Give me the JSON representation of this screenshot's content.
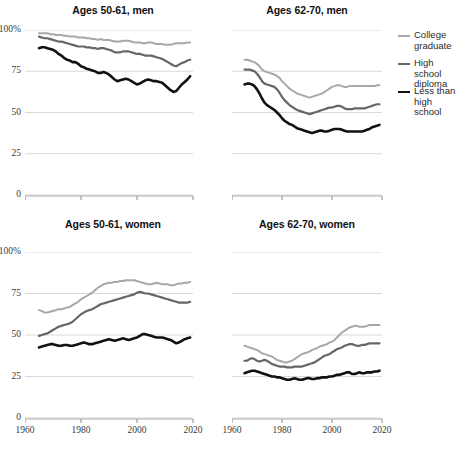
{
  "figure": {
    "width": 460,
    "height": 454,
    "background": "#ffffff"
  },
  "legend": {
    "position": "right-top",
    "items": [
      {
        "label": "College\ngraduate",
        "color": "#a8a8a8",
        "width": 2.0,
        "name": "college-graduate"
      },
      {
        "label": "High school\ndiploma",
        "color": "#666666",
        "width": 2.2,
        "name": "high-school-diploma"
      },
      {
        "label": "Less than\nhigh school",
        "color": "#111111",
        "width": 2.6,
        "name": "less-than-high-school"
      }
    ]
  },
  "axes": {
    "ylim": [
      0,
      100
    ],
    "yticks": [
      0,
      25,
      50,
      75,
      100
    ],
    "yticklabels": [
      "0",
      "25",
      "50",
      "75",
      "100%"
    ],
    "xlim": [
      1960,
      2020
    ],
    "xticks": [
      1960,
      1980,
      2000,
      2020
    ],
    "xticklabels": [
      "1960",
      "1980",
      "2000",
      "2020"
    ],
    "gridcolor": "#d9d9d9",
    "grid": true,
    "legend_shown_on_panel": 1
  },
  "chart_data": {
    "type": "line",
    "title": "",
    "xlabel": "",
    "ylabel": "",
    "ylim": [
      0,
      100
    ],
    "xlim": [
      1960,
      2020
    ],
    "grid": true,
    "legend_position": "right",
    "panels": [
      {
        "title": "Ages 50-61, men",
        "row": 0,
        "col": 0,
        "x": [
          1965,
          1966,
          1967,
          1968,
          1969,
          1970,
          1971,
          1972,
          1973,
          1974,
          1975,
          1976,
          1977,
          1978,
          1979,
          1980,
          1981,
          1982,
          1983,
          1984,
          1985,
          1986,
          1987,
          1988,
          1989,
          1990,
          1991,
          1992,
          1993,
          1994,
          1995,
          1996,
          1997,
          1998,
          1999,
          2000,
          2001,
          2002,
          2003,
          2004,
          2005,
          2006,
          2007,
          2008,
          2009,
          2010,
          2011,
          2012,
          2013,
          2014,
          2015,
          2016,
          2017,
          2018,
          2019
        ],
        "series": [
          {
            "name": "College graduate",
            "color": "#a8a8a8",
            "values": [
              98,
              98,
              98,
              98,
              97.5,
              97.5,
              97,
              97,
              97,
              96.5,
              96.5,
              96,
              96,
              96,
              95.5,
              95.5,
              95.5,
              95,
              95,
              94.5,
              94.5,
              94,
              94.5,
              94,
              94,
              94,
              93.5,
              93,
              93,
              93,
              93.5,
              93.5,
              93.5,
              93,
              92.5,
              92.5,
              92.5,
              92,
              92,
              92.5,
              92.5,
              92,
              91.5,
              91.5,
              91.5,
              91,
              91,
              91,
              91.5,
              92,
              92,
              92,
              92,
              92.5,
              92.5
            ]
          },
          {
            "name": "High school diploma",
            "color": "#666666",
            "values": [
              96,
              95.5,
              95,
              95,
              94.5,
              94,
              93.5,
              93,
              93,
              92.5,
              92,
              91.5,
              91,
              90.5,
              90,
              90,
              90,
              89.5,
              89.5,
              89,
              89,
              88.5,
              89,
              89,
              88.5,
              88,
              87.5,
              86.5,
              86.5,
              86.5,
              87,
              87,
              87,
              86.5,
              86,
              85.5,
              85.5,
              85,
              84.5,
              84.5,
              84.5,
              84,
              83.5,
              83,
              82.5,
              81.5,
              80.5,
              79.5,
              78.5,
              78,
              79,
              80,
              80.5,
              81.5,
              82
            ]
          },
          {
            "name": "Less than high school",
            "color": "#111111",
            "values": [
              89,
              89.5,
              89.5,
              89,
              88.5,
              88,
              87,
              85.5,
              84.5,
              83,
              82,
              81.5,
              80.5,
              80.5,
              79.5,
              78,
              77.5,
              76.5,
              76,
              75.5,
              75,
              74,
              74,
              74.5,
              74,
              73,
              71.5,
              70,
              69,
              69.5,
              70,
              70.5,
              70,
              69,
              68,
              67,
              67.5,
              68.5,
              69.5,
              70,
              69.5,
              69,
              69,
              68.5,
              68,
              66.5,
              65,
              63.5,
              62.5,
              63,
              65,
              67,
              68.5,
              70,
              72
            ]
          }
        ]
      },
      {
        "title": "Ages 62-70, men",
        "row": 0,
        "col": 1,
        "x": [
          1965,
          1966,
          1967,
          1968,
          1969,
          1970,
          1971,
          1972,
          1973,
          1974,
          1975,
          1976,
          1977,
          1978,
          1979,
          1980,
          1981,
          1982,
          1983,
          1984,
          1985,
          1986,
          1987,
          1988,
          1989,
          1990,
          1991,
          1992,
          1993,
          1994,
          1995,
          1996,
          1997,
          1998,
          1999,
          2000,
          2001,
          2002,
          2003,
          2004,
          2005,
          2006,
          2007,
          2008,
          2009,
          2010,
          2011,
          2012,
          2013,
          2014,
          2015,
          2016,
          2017,
          2018,
          2019
        ],
        "series": [
          {
            "name": "College graduate",
            "color": "#a8a8a8",
            "values": [
              82,
              82,
              81.5,
              81,
              80.5,
              79.5,
              78,
              76,
              75,
              74.5,
              74,
              73.5,
              73,
              72,
              71,
              69,
              67.5,
              66,
              64.5,
              63.5,
              62.5,
              61.5,
              61,
              60.5,
              60,
              59.5,
              59,
              59.5,
              60,
              60.5,
              61,
              61.5,
              62.5,
              63.5,
              64.5,
              65.5,
              66,
              66.5,
              66.5,
              66,
              65.5,
              65.5,
              66,
              66,
              66,
              66,
              66,
              66,
              66,
              66,
              66,
              66,
              66,
              66.5,
              66.5
            ]
          },
          {
            "name": "High school diploma",
            "color": "#666666",
            "values": [
              76,
              76,
              76,
              75.5,
              75,
              73.5,
              71.5,
              69,
              67.5,
              67,
              66.5,
              66,
              65.5,
              64,
              62,
              59.5,
              57.5,
              56,
              54.5,
              53.5,
              52.5,
              51.5,
              51,
              50.5,
              50,
              49.5,
              49,
              49.5,
              50,
              50.5,
              51,
              51.5,
              52,
              52.5,
              53,
              53,
              53.5,
              54,
              54,
              53.5,
              52.5,
              52,
              52,
              52,
              52.5,
              52.5,
              52.5,
              52.5,
              52.5,
              53,
              53.5,
              54,
              54.5,
              55,
              55
            ]
          },
          {
            "name": "Less than high school",
            "color": "#111111",
            "values": [
              67,
              67.5,
              67.5,
              67,
              66,
              64,
              61.5,
              58.5,
              56,
              54.5,
              53.5,
              52.5,
              51.5,
              50,
              48.5,
              46.5,
              45,
              44,
              43,
              42.5,
              41.5,
              40.5,
              40,
              39.5,
              39,
              38.5,
              38,
              37.5,
              38,
              38.5,
              39,
              39,
              38.5,
              38.5,
              39,
              39.5,
              40,
              40,
              40,
              39.5,
              39,
              38.5,
              38.5,
              38.5,
              38.5,
              38.5,
              38.5,
              38.5,
              39,
              39.5,
              40,
              41,
              41.5,
              42,
              42.5
            ]
          }
        ]
      },
      {
        "title": "Ages 50-61, women",
        "row": 1,
        "col": 0,
        "x": [
          1965,
          1966,
          1967,
          1968,
          1969,
          1970,
          1971,
          1972,
          1973,
          1974,
          1975,
          1976,
          1977,
          1978,
          1979,
          1980,
          1981,
          1982,
          1983,
          1984,
          1985,
          1986,
          1987,
          1988,
          1989,
          1990,
          1991,
          1992,
          1993,
          1994,
          1995,
          1996,
          1997,
          1998,
          1999,
          2000,
          2001,
          2002,
          2003,
          2004,
          2005,
          2006,
          2007,
          2008,
          2009,
          2010,
          2011,
          2012,
          2013,
          2014,
          2015,
          2016,
          2017,
          2018,
          2019
        ],
        "series": [
          {
            "name": "College graduate",
            "color": "#a8a8a8",
            "values": [
              65,
              64.5,
              63.5,
              63.5,
              64,
              64.5,
              65,
              65.5,
              65.5,
              66,
              66.5,
              67,
              68,
              69,
              70,
              71.5,
              72.5,
              73.5,
              74.5,
              75.5,
              77,
              78.5,
              79.5,
              80.5,
              81,
              81.5,
              81.5,
              82,
              82,
              82.5,
              82.5,
              83,
              83,
              83,
              83,
              82.5,
              82,
              81.5,
              81,
              80.5,
              80.5,
              81,
              81.5,
              81,
              80.5,
              80.5,
              80.5,
              80,
              80,
              80.5,
              81,
              81,
              81.5,
              81.5,
              82
            ]
          },
          {
            "name": "High school diploma",
            "color": "#666666",
            "values": [
              49.5,
              50,
              50.5,
              51,
              52,
              53,
              54,
              55,
              55.5,
              56,
              56.5,
              57,
              58,
              59.5,
              61,
              62.5,
              63.5,
              64.5,
              65,
              65.5,
              66.5,
              67.5,
              68.5,
              69,
              69.5,
              70,
              70.5,
              71,
              71.5,
              72,
              72.5,
              73,
              73.5,
              74,
              74.5,
              75.5,
              76,
              75.5,
              75,
              75,
              74.5,
              74,
              73.5,
              73,
              72.5,
              72,
              71.5,
              71,
              70.5,
              70,
              69.5,
              69.5,
              69.5,
              69.5,
              70
            ]
          },
          {
            "name": "Less than high school",
            "color": "#111111",
            "values": [
              42.5,
              43,
              43.5,
              44,
              44.5,
              44.5,
              44,
              43.5,
              43.5,
              44,
              44,
              43.5,
              43.5,
              44,
              44.5,
              45,
              45.5,
              45,
              44.5,
              44.5,
              45,
              45.5,
              46,
              46.5,
              47,
              47.5,
              47,
              46.5,
              47,
              47.5,
              48,
              47.5,
              47,
              47.5,
              48,
              48.5,
              49.5,
              50.5,
              50.5,
              50,
              49.5,
              49,
              48.5,
              48.5,
              48.5,
              48,
              47.5,
              47,
              46,
              45,
              45.5,
              46.5,
              47.5,
              48,
              48.5
            ]
          }
        ]
      },
      {
        "title": "Ages 62-70, women",
        "row": 1,
        "col": 1,
        "x": [
          1965,
          1966,
          1967,
          1968,
          1969,
          1970,
          1971,
          1972,
          1973,
          1974,
          1975,
          1976,
          1977,
          1978,
          1979,
          1980,
          1981,
          1982,
          1983,
          1984,
          1985,
          1986,
          1987,
          1988,
          1989,
          1990,
          1991,
          1992,
          1993,
          1994,
          1995,
          1996,
          1997,
          1998,
          1999,
          2000,
          2001,
          2002,
          2003,
          2004,
          2005,
          2006,
          2007,
          2008,
          2009,
          2010,
          2011,
          2012,
          2013,
          2014,
          2015,
          2016,
          2017,
          2018,
          2019
        ],
        "series": [
          {
            "name": "College graduate",
            "color": "#a8a8a8",
            "values": [
              43.5,
              43,
              42.5,
              42,
              41.5,
              41,
              40,
              39,
              38.5,
              38,
              37.5,
              37,
              36,
              35,
              34.5,
              34,
              33.5,
              33.5,
              34,
              34.5,
              35.5,
              36.5,
              37.5,
              38.5,
              39,
              39.5,
              40,
              41,
              41.5,
              42,
              43,
              43.5,
              44,
              44.5,
              45.5,
              46,
              47,
              48.5,
              50,
              51.5,
              52.5,
              53.5,
              54.5,
              55,
              55.5,
              55.5,
              55,
              55,
              55,
              55.5,
              56,
              56,
              56,
              56,
              56
            ]
          },
          {
            "name": "High school diploma",
            "color": "#666666",
            "values": [
              34.5,
              34.5,
              35.5,
              36,
              35.5,
              34.5,
              34,
              34.5,
              35,
              34.5,
              33.5,
              32.5,
              32,
              31.5,
              31,
              31,
              31,
              30.5,
              30.5,
              30.5,
              31,
              31,
              31,
              31,
              31.5,
              32,
              32.5,
              33,
              33.5,
              34.5,
              35.5,
              36.5,
              37.5,
              38,
              38.5,
              39.5,
              40.5,
              41.5,
              42,
              42.5,
              43.5,
              44,
              44.5,
              44.5,
              44,
              43.5,
              43.5,
              44,
              44,
              44.5,
              45,
              45,
              45,
              45,
              45
            ]
          },
          {
            "name": "Less than high school",
            "color": "#111111",
            "values": [
              27,
              27.5,
              28,
              28.5,
              28.5,
              28,
              27.5,
              27,
              26.5,
              26,
              25.5,
              25,
              25,
              24.5,
              24.5,
              24,
              23.5,
              23,
              23,
              23.5,
              24,
              23.5,
              23,
              23,
              23.5,
              24,
              24,
              23.5,
              23.5,
              24,
              24,
              24.5,
              24.5,
              24.5,
              25,
              25,
              25.5,
              26,
              26,
              26.5,
              27,
              27.5,
              27.5,
              26.5,
              26.5,
              27,
              27.5,
              27,
              27,
              27.5,
              27.5,
              27.5,
              28,
              28,
              28.5
            ]
          }
        ]
      }
    ]
  }
}
